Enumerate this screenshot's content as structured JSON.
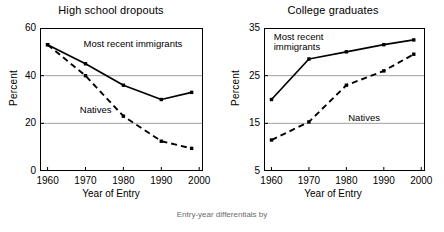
{
  "figure": {
    "caption": "Entry-year differentials by",
    "background": "#ffffff",
    "line_color": "#000000"
  },
  "chart_data": [
    {
      "type": "line",
      "title": "High school dropouts",
      "xlabel": "Year of Entry",
      "ylabel": "Percent",
      "x": [
        1960,
        1970,
        1980,
        1990,
        1998
      ],
      "xticks": [
        "1960",
        "1970",
        "1980",
        "1990",
        "2000"
      ],
      "xtick_values": [
        1960,
        1970,
        1980,
        1990,
        2000
      ],
      "yticks": [
        "0",
        "20",
        "40",
        "60"
      ],
      "ytick_values": [
        0,
        20,
        40,
        60
      ],
      "xlim": [
        1958,
        2001
      ],
      "ylim": [
        0,
        60
      ],
      "grid": "horizontal",
      "legend": "inline-annotation",
      "series": [
        {
          "name": "Most recent immigrants",
          "style": "solid",
          "marker": "filled-square",
          "values": [
            53,
            45,
            36,
            30,
            33
          ],
          "label_x": 1969.5,
          "label_y": 55.5
        },
        {
          "name": "Natives",
          "style": "dashed",
          "marker": "filled-square",
          "values": [
            53,
            40,
            23,
            12.5,
            9.5
          ],
          "label_x": 1968.5,
          "label_y": 27.5
        }
      ]
    },
    {
      "type": "line",
      "title": "College graduates",
      "xlabel": "Year of Entry",
      "ylabel": "Percent",
      "x": [
        1960,
        1970,
        1980,
        1990,
        1998
      ],
      "xticks": [
        "1960",
        "1970",
        "1980",
        "1990",
        "2000"
      ],
      "xtick_values": [
        1960,
        1970,
        1980,
        1990,
        2000
      ],
      "yticks": [
        "5",
        "15",
        "25",
        "35"
      ],
      "ytick_values": [
        5,
        15,
        25,
        35
      ],
      "xlim": [
        1958,
        2001
      ],
      "ylim": [
        5,
        35
      ],
      "grid": "horizontal",
      "legend": "inline-annotation",
      "series": [
        {
          "name": "Most recent\nimmigrants",
          "style": "solid",
          "marker": "filled-square",
          "values": [
            20,
            28.5,
            30,
            31.5,
            32.5
          ],
          "label_x": 1960.6,
          "label_y": 34.2
        },
        {
          "name": "Natives",
          "style": "dashed",
          "marker": "filled-square",
          "values": [
            11.5,
            15.3,
            23,
            26,
            29.5
          ],
          "label_x": 1980.5,
          "label_y": 17.2
        }
      ]
    }
  ]
}
